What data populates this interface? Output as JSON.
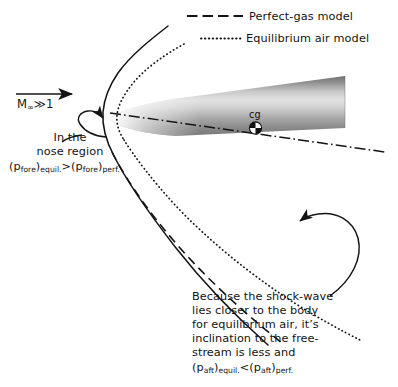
{
  "figure": {
    "title_absent": true,
    "background": "#ffffff",
    "ink": "#141414"
  },
  "legend": {
    "position": "top-right",
    "items": [
      {
        "label": "Perfect-gas model",
        "style": "dashed",
        "icon": "dashed-line-icon"
      },
      {
        "label": "Equilibrium air model",
        "style": "dotted",
        "icon": "dotted-line-icon"
      }
    ]
  },
  "flow": {
    "mach_symbol": "M",
    "mach_subscript": "∞",
    "mach_relation": "≫1",
    "arrow": "flow-direction-arrow"
  },
  "body": {
    "name": "slender-cone-vehicle",
    "cg_label": "cg",
    "cg_marker": "center-of-gravity-icon",
    "centerline": "dash-dot-axis"
  },
  "annotations": {
    "nose": {
      "lines": [
        "In the",
        "nose region"
      ],
      "formula": {
        "left_paren": "(",
        "p": "p",
        "p_sub": "fore",
        "right_paren": ")",
        "left_state": "equil.",
        "operator": ">",
        "p2": "p",
        "p2_sub": "fore",
        "right_state": "perf."
      },
      "full_text": "In the nose region (p_fore)equil. > (p_fore)perf.",
      "leader": "nose-leader-arrow"
    },
    "aft": {
      "lines": [
        "Because the shock-wave",
        "lies closer to the body",
        "for equilibrium air, it’s",
        "inclination to the free-",
        "stream is less and"
      ],
      "formula": {
        "left_paren": "(",
        "p": "p",
        "p_sub": "aft",
        "right_paren": ")",
        "left_state": "equil.",
        "operator": "<",
        "p2": "p",
        "p2_sub": "aft",
        "right_state": "perf."
      },
      "full_text": "Because the shock-wave lies closer to the body for equilibrium air, it’s inclination to the free-stream is less and (p_aft)equil. < (p_aft)perf.",
      "leader": "aft-curved-leader-arrow"
    }
  },
  "curves": {
    "upper_perfect_shock": "solid-upper-shock",
    "upper_equilibrium_shock": "dotted-upper-shock",
    "lower_perfect_shock": "dashed-lower-shock",
    "lower_equilibrium_shock": "dotted-lower-shock"
  }
}
